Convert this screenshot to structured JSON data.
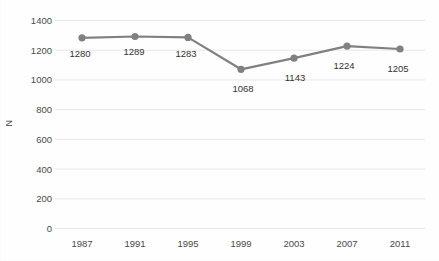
{
  "chart_data": {
    "type": "line",
    "title": "",
    "subtitle": "",
    "xlabel": "",
    "ylabel": "N",
    "categories": [
      "1987",
      "1991",
      "1995",
      "1999",
      "2003",
      "2007",
      "2011"
    ],
    "x": [
      1987,
      1991,
      1995,
      1999,
      2003,
      2007,
      2011
    ],
    "values": [
      1280,
      1289,
      1283,
      1068,
      1143,
      1224,
      1205
    ],
    "data_labels": [
      "1280",
      "1289",
      "1283",
      "1068",
      "1143",
      "1224",
      "1205"
    ],
    "ylim": [
      0,
      1400
    ],
    "ytick_values": [
      0,
      200,
      400,
      600,
      800,
      1000,
      1200,
      1400
    ],
    "ytick_labels": [
      "0",
      "200",
      "400",
      "600",
      "800",
      "1000",
      "1200",
      "1400"
    ],
    "ytick_step": 200,
    "grid": true,
    "grid_axis": "y",
    "legend": false,
    "legend_position": "none",
    "series": [
      {
        "name": "N",
        "values": [
          1280,
          1289,
          1283,
          1068,
          1143,
          1224,
          1205
        ],
        "marker": "circle"
      }
    ],
    "colors": {
      "line": "#808080",
      "marker": "#808080",
      "gridline": "#e8e8e8",
      "tick_label": "#4a4a4a",
      "data_label": "#333333",
      "axis_title": "#3a3a3a",
      "background": "#fefefe"
    }
  }
}
